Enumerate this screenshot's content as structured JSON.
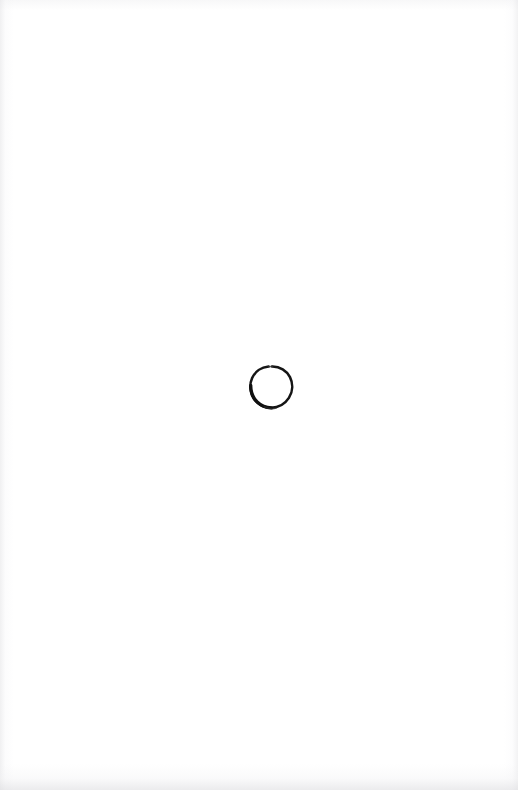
{
  "page": {
    "kind": "scanned-paper-sheet",
    "width": 518,
    "height": 790,
    "background_color": "#fefefe",
    "paper_color": "#ffffff",
    "content_description": "A blank white scanned sheet of paper with a single small hand-drawn circle near the center."
  },
  "marks": [
    {
      "name": "hand-drawn-circle",
      "shape": "circle",
      "filled": false,
      "ink_color": "#151515",
      "center_x": 271,
      "center_y": 387,
      "width": 43,
      "height": 43,
      "bounds": {
        "left": 250,
        "top": 366,
        "right": 293,
        "bottom": 409
      },
      "stroke_width_min": 1.8,
      "stroke_width_max": 3.4,
      "notes": "Irregular freehand loop; stroke is thicker and darker along the lower-left arc and closes with a small overlapping tail at the bottom."
    }
  ],
  "artifacts": {
    "edge_shading_color": "#e6e6e8",
    "bottom_smudge_color": "#dededf",
    "description": "Faint greyish scanner vignette along the left, right and top borders, plus a soft grey smudge band across the bottom edge."
  }
}
